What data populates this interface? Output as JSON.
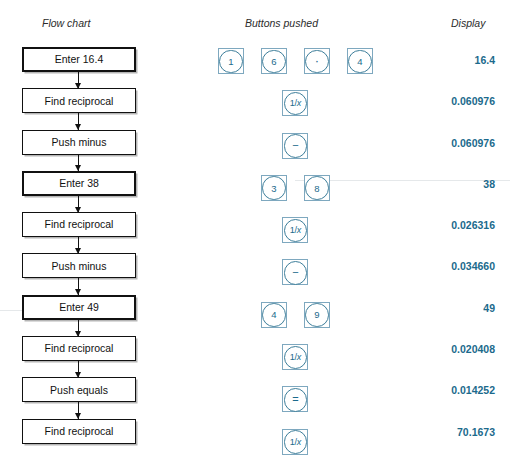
{
  "headers": {
    "flow_chart": "Flow chart",
    "buttons_pushed": "Buttons pushed",
    "display": "Display"
  },
  "colors": {
    "accent_blue": "#1b6a8c",
    "button_outline": "#7ea8bf",
    "circle_outline": "#3d7e9a",
    "box_border": "#111111",
    "text": "#1a1a1a"
  },
  "rows": [
    {
      "step": "Enter 16.4",
      "emphasis": true,
      "buttons": [
        {
          "glyph": "1",
          "name": "calc-button-1",
          "kind": "digit"
        },
        {
          "glyph": "6",
          "name": "calc-button-6",
          "kind": "digit"
        },
        {
          "glyph": "·",
          "name": "calc-button-decimal-point",
          "kind": "dot"
        },
        {
          "glyph": "4",
          "name": "calc-button-4",
          "kind": "digit"
        }
      ],
      "display": "16.4"
    },
    {
      "step": "Find reciprocal",
      "emphasis": false,
      "buttons": [
        {
          "glyph": "1/x",
          "name": "calc-button-reciprocal",
          "kind": "recip"
        }
      ],
      "display": "0.060976"
    },
    {
      "step": "Push minus",
      "emphasis": false,
      "buttons": [
        {
          "glyph": "−",
          "name": "calc-button-minus",
          "kind": "op"
        }
      ],
      "display": "0.060976"
    },
    {
      "step": "Enter 38",
      "emphasis": true,
      "buttons": [
        {
          "glyph": "3",
          "name": "calc-button-3",
          "kind": "digit"
        },
        {
          "glyph": "8",
          "name": "calc-button-8",
          "kind": "digit"
        }
      ],
      "display": "38"
    },
    {
      "step": "Find reciprocal",
      "emphasis": false,
      "buttons": [
        {
          "glyph": "1/x",
          "name": "calc-button-reciprocal",
          "kind": "recip"
        }
      ],
      "display": "0.026316"
    },
    {
      "step": "Push minus",
      "emphasis": false,
      "buttons": [
        {
          "glyph": "−",
          "name": "calc-button-minus",
          "kind": "op"
        }
      ],
      "display": "0.034660"
    },
    {
      "step": "Enter 49",
      "emphasis": true,
      "buttons": [
        {
          "glyph": "4",
          "name": "calc-button-4",
          "kind": "digit"
        },
        {
          "glyph": "9",
          "name": "calc-button-9",
          "kind": "digit"
        }
      ],
      "display": "49"
    },
    {
      "step": "Find reciprocal",
      "emphasis": false,
      "buttons": [
        {
          "glyph": "1/x",
          "name": "calc-button-reciprocal",
          "kind": "recip"
        }
      ],
      "display": "0.020408"
    },
    {
      "step": "Push equals",
      "emphasis": false,
      "buttons": [
        {
          "glyph": "=",
          "name": "calc-button-equals",
          "kind": "op"
        }
      ],
      "display": "0.014252"
    },
    {
      "step": "Find reciprocal",
      "emphasis": false,
      "buttons": [
        {
          "glyph": "1/x",
          "name": "calc-button-reciprocal",
          "kind": "recip"
        }
      ],
      "display": "70.1673"
    }
  ]
}
